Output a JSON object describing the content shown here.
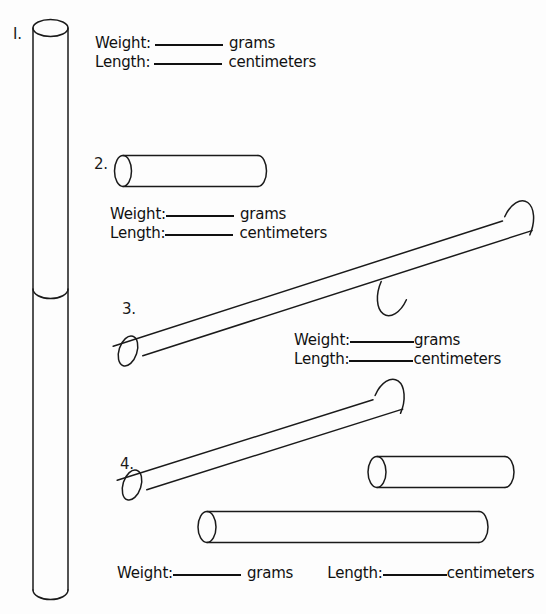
{
  "page": {
    "background_color": "#fdfdfd",
    "ink_color": "#111111",
    "width": 546,
    "height": 614
  },
  "labels": {
    "weight": "Weight:",
    "length": "Length:",
    "grams": "grams",
    "centimeters": "centimeters"
  },
  "items": [
    {
      "number": "I.",
      "name": "tall-vertical-cylinder",
      "fields": {
        "weight_label": "Weight:",
        "weight_unit": "grams",
        "length_label": "Length:",
        "length_unit": "centimeters",
        "weight_value": "",
        "length_value": ""
      }
    },
    {
      "number": "2.",
      "name": "short-horizontal-cylinder",
      "fields": {
        "weight_label": "Weight:",
        "weight_unit": "grams",
        "length_label": "Length:",
        "length_unit": "centimeters",
        "weight_value": "",
        "length_value": ""
      }
    },
    {
      "number": "3.",
      "name": "long-diagonal-cylinder",
      "fields": {
        "weight_label": "Weight:",
        "weight_unit": "grams",
        "length_label": "Length:",
        "length_unit": "centimeters",
        "weight_value": "",
        "length_value": ""
      }
    },
    {
      "number": "4.",
      "name": "three-cylinder-group",
      "fields": {
        "weight_label": "Weight:",
        "weight_unit": "grams",
        "length_label": "Length:",
        "length_unit": "centimeters",
        "weight_value": "",
        "length_value": ""
      }
    }
  ],
  "figures": [
    {
      "name": "cylinder-1-vertical",
      "orientation": "vertical",
      "has_seam": true
    },
    {
      "name": "cylinder-2-horizontal",
      "orientation": "horizontal",
      "has_seam": false
    },
    {
      "name": "cylinder-3-diagonal",
      "orientation": "diagonal",
      "has_seam": true
    },
    {
      "name": "cylinder-4-diagonal",
      "orientation": "diagonal",
      "has_seam": false
    },
    {
      "name": "cylinder-5-horizontal-right",
      "orientation": "horizontal",
      "has_seam": false
    },
    {
      "name": "cylinder-6-horizontal-lower",
      "orientation": "horizontal",
      "has_seam": false
    }
  ]
}
